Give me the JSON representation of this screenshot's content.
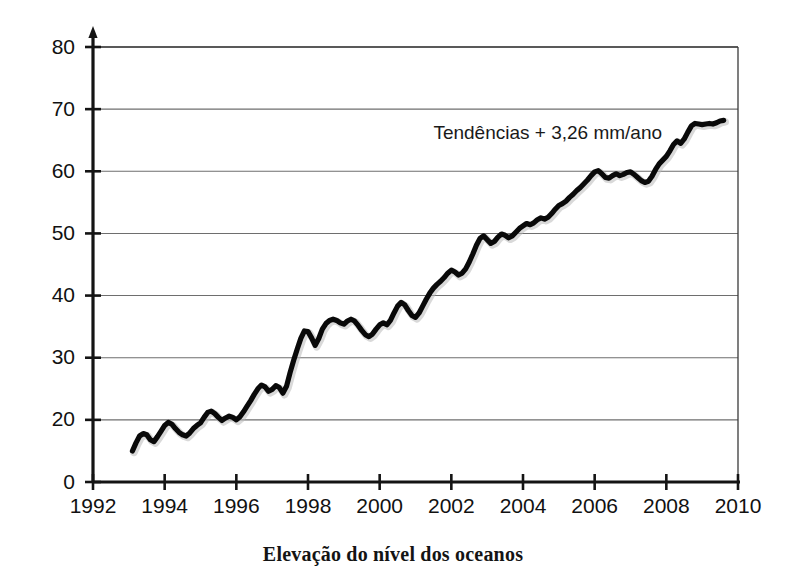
{
  "caption": "Elevação do nível dos oceanos",
  "annotation": "Tendências + 3,26 mm/ano",
  "colors": {
    "line": "#090909",
    "grid": "#6e6e6e",
    "axis": "#141414",
    "background": "#ffffff",
    "text": "#111111"
  },
  "axes": {
    "x_labels": [
      "1992",
      "1994",
      "1996",
      "1998",
      "2000",
      "2002",
      "2004",
      "2006",
      "2008",
      "2010"
    ],
    "y_labels": [
      "0",
      "20",
      "30",
      "40",
      "50",
      "60",
      "70",
      "80"
    ]
  },
  "chart_data": {
    "type": "line",
    "title": "Elevação do nível dos oceanos",
    "subtitle": "",
    "xlabel": "",
    "ylabel": "",
    "xlim": [
      1992,
      2010
    ],
    "ylim": [
      0,
      80
    ],
    "xticks": [
      1992,
      1994,
      1996,
      1998,
      2000,
      2002,
      2004,
      2006,
      2008,
      2010
    ],
    "yticks": [
      0,
      20,
      30,
      40,
      50,
      60,
      70,
      80
    ],
    "ytick_labels": [
      "0",
      "20",
      "30",
      "40",
      "50",
      "60",
      "70",
      "80"
    ],
    "grid": true,
    "grid_axis": "y",
    "legend": false,
    "annotations": [
      {
        "text": "Tendências + 3,26 mm/ano",
        "x": 2001.5,
        "y": 66,
        "trend_mm_per_year": 3.26
      }
    ],
    "series": [
      {
        "name": "Elevação do nível do mar",
        "units": "mm",
        "x": [
          1993.1,
          1993.2,
          1993.3,
          1993.4,
          1993.5,
          1993.6,
          1993.7,
          1993.8,
          1993.9,
          1994.0,
          1994.1,
          1994.2,
          1994.3,
          1994.4,
          1994.5,
          1994.6,
          1994.7,
          1994.8,
          1994.9,
          1995.0,
          1995.1,
          1995.2,
          1995.3,
          1995.4,
          1995.5,
          1995.6,
          1995.7,
          1995.8,
          1995.9,
          1996.0,
          1996.1,
          1996.2,
          1996.3,
          1996.4,
          1996.5,
          1996.6,
          1996.7,
          1996.8,
          1996.9,
          1997.0,
          1997.1,
          1997.2,
          1997.3,
          1997.4,
          1997.5,
          1997.6,
          1997.7,
          1997.8,
          1997.9,
          1998.0,
          1998.1,
          1998.2,
          1998.3,
          1998.4,
          1998.5,
          1998.6,
          1998.7,
          1998.8,
          1998.9,
          1999.0,
          1999.1,
          1999.2,
          1999.3,
          1999.4,
          1999.5,
          1999.6,
          1999.7,
          1999.8,
          1999.9,
          2000.0,
          2000.1,
          2000.2,
          2000.3,
          2000.4,
          2000.5,
          2000.6,
          2000.7,
          2000.8,
          2000.9,
          2001.0,
          2001.1,
          2001.2,
          2001.3,
          2001.4,
          2001.5,
          2001.6,
          2001.7,
          2001.8,
          2001.9,
          2002.0,
          2002.1,
          2002.2,
          2002.3,
          2002.4,
          2002.5,
          2002.6,
          2002.7,
          2002.8,
          2002.9,
          2003.0,
          2003.1,
          2003.2,
          2003.3,
          2003.4,
          2003.5,
          2003.6,
          2003.7,
          2003.8,
          2003.9,
          2004.0,
          2004.1,
          2004.2,
          2004.3,
          2004.4,
          2004.5,
          2004.6,
          2004.7,
          2004.8,
          2004.9,
          2005.0,
          2005.1,
          2005.2,
          2005.3,
          2005.4,
          2005.5,
          2005.6,
          2005.7,
          2005.8,
          2005.9,
          2006.0,
          2006.1,
          2006.2,
          2006.3,
          2006.4,
          2006.5,
          2006.6,
          2006.7,
          2006.8,
          2006.9,
          2007.0,
          2007.1,
          2007.2,
          2007.3,
          2007.4,
          2007.5,
          2007.6,
          2007.7,
          2007.8,
          2007.9,
          2008.0,
          2008.1,
          2008.2,
          2008.3,
          2008.4,
          2008.5,
          2008.6,
          2008.7,
          2008.8,
          2008.9,
          2009.0,
          2009.1,
          2009.2,
          2009.3,
          2009.4,
          2009.5,
          2009.6
        ],
        "y": [
          15.0,
          16.3,
          17.4,
          17.8,
          17.6,
          16.8,
          16.5,
          17.3,
          18.2,
          19.1,
          19.6,
          19.3,
          18.6,
          18.0,
          17.6,
          17.4,
          17.9,
          18.6,
          19.1,
          19.5,
          20.4,
          21.2,
          21.4,
          21.0,
          20.4,
          19.9,
          20.3,
          20.6,
          20.4,
          20.0,
          20.5,
          21.3,
          22.2,
          23.1,
          24.1,
          25.0,
          25.6,
          25.3,
          24.6,
          24.9,
          25.5,
          25.2,
          24.3,
          25.4,
          27.6,
          29.6,
          31.4,
          33.1,
          34.3,
          34.2,
          33.2,
          32.0,
          33.1,
          34.6,
          35.5,
          36.0,
          36.2,
          36.0,
          35.6,
          35.4,
          35.9,
          36.2,
          35.9,
          35.2,
          34.4,
          33.7,
          33.4,
          33.8,
          34.6,
          35.3,
          35.6,
          35.3,
          36.0,
          37.2,
          38.3,
          38.9,
          38.5,
          37.6,
          36.8,
          36.5,
          37.2,
          38.3,
          39.4,
          40.4,
          41.2,
          41.8,
          42.3,
          42.9,
          43.6,
          44.1,
          43.8,
          43.3,
          43.6,
          44.3,
          45.4,
          46.7,
          48.1,
          49.2,
          49.6,
          49.0,
          48.4,
          48.7,
          49.4,
          49.9,
          49.7,
          49.3,
          49.6,
          50.2,
          50.8,
          51.2,
          51.6,
          51.4,
          51.7,
          52.2,
          52.5,
          52.3,
          52.6,
          53.2,
          53.9,
          54.5,
          54.8,
          55.2,
          55.8,
          56.3,
          56.9,
          57.4,
          58.0,
          58.6,
          59.3,
          59.9,
          60.1,
          59.6,
          59.0,
          58.9,
          59.3,
          59.6,
          59.3,
          59.5,
          59.8,
          59.9,
          59.5,
          59.0,
          58.5,
          58.2,
          58.4,
          59.2,
          60.3,
          61.2,
          61.8,
          62.4,
          63.3,
          64.3,
          64.9,
          64.5,
          65.2,
          66.3,
          67.3,
          67.7,
          67.6,
          67.5,
          67.6,
          67.7,
          67.6,
          67.8,
          68.1,
          68.2
        ]
      }
    ]
  }
}
